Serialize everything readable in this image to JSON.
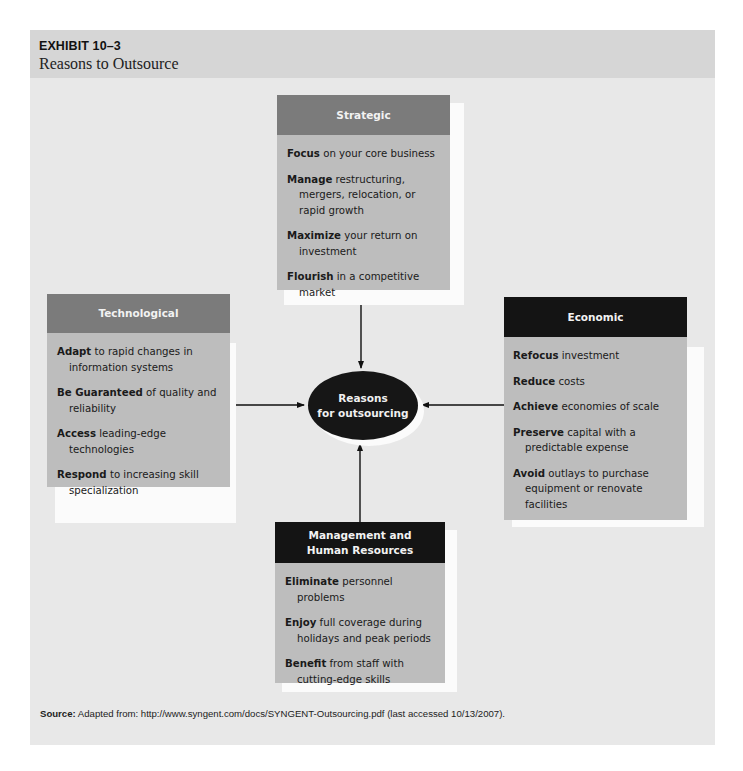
{
  "exhibit": {
    "number": "EXHIBIT 10–3",
    "title": "Reasons to Outsource"
  },
  "hub": {
    "line1": "Reasons",
    "line2": "for outsourcing",
    "fill": "#161616"
  },
  "categories": {
    "strategic": {
      "title": "Strategic",
      "header_color": "#7b7b7b",
      "items": [
        {
          "bold": "Focus",
          "rest": " on your core business"
        },
        {
          "bold": "Manage",
          "rest": " restructuring, mergers, relocation, or rapid growth"
        },
        {
          "bold": "Maximize",
          "rest": " your return on investment"
        },
        {
          "bold": "Flourish",
          "rest": " in a competitive market"
        }
      ]
    },
    "technological": {
      "title": "Technological",
      "header_color": "#7b7b7b",
      "items": [
        {
          "bold": "Adapt",
          "rest": " to rapid changes in information systems"
        },
        {
          "bold": "Be Guaranteed",
          "rest": " of quality and reliability"
        },
        {
          "bold": "Access",
          "rest": " leading-edge technologies"
        },
        {
          "bold": "Respond",
          "rest": " to increasing skill specialization"
        }
      ]
    },
    "economic": {
      "title": "Economic",
      "header_color": "#141414",
      "items": [
        {
          "bold": "Refocus",
          "rest": " investment"
        },
        {
          "bold": "Reduce",
          "rest": " costs"
        },
        {
          "bold": "Achieve",
          "rest": " economies of scale"
        },
        {
          "bold": "Preserve",
          "rest": " capital with a predictable expense"
        },
        {
          "bold": "Avoid",
          "rest": " outlays to purchase equipment or renovate facilities"
        }
      ]
    },
    "management": {
      "title_line1": "Management and",
      "title_line2": "Human Resources",
      "header_color": "#141414",
      "items": [
        {
          "bold": "Eliminate",
          "rest": " personnel problems"
        },
        {
          "bold": "Enjoy",
          "rest": " full coverage during holidays and peak periods"
        },
        {
          "bold": "Benefit",
          "rest": " from staff with cutting-edge skills"
        }
      ]
    }
  },
  "source": {
    "label": "Source:",
    "text": " Adapted from: http://www.syngent.com/docs/SYNGENT-Outsourcing.pdf (last accessed 10/13/2007)."
  }
}
